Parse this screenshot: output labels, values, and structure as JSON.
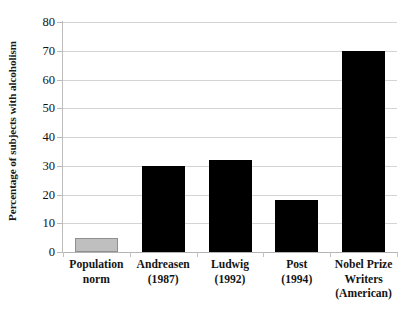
{
  "chart_data": {
    "type": "bar",
    "title": "",
    "xlabel": "",
    "ylabel": "Percentage of subjects with alcoholism",
    "ylim": [
      0,
      80
    ],
    "ytick_step": 10,
    "yticks": [
      "80",
      "70",
      "60",
      "50",
      "40",
      "30",
      "20",
      "10",
      "0"
    ],
    "ytick_values": [
      80,
      70,
      60,
      50,
      40,
      30,
      20,
      10,
      0
    ],
    "grid": "horizontal",
    "legend": "none",
    "categories": [
      "Population norm",
      "Andreasen (1987)",
      "Ludwig (1992)",
      "Post (1994)",
      "Nobel Prize Writers (American)"
    ],
    "category_lines": [
      [
        "Population",
        "norm"
      ],
      [
        "Andreasen",
        "(1987)"
      ],
      [
        "Ludwig",
        "(1992)"
      ],
      [
        "Post",
        "(1994)"
      ],
      [
        "Nobel Prize",
        "Writers",
        "(American)"
      ]
    ],
    "values": [
      5,
      30,
      32,
      18,
      70
    ],
    "bar_colors": [
      "#bfbfbf",
      "#000000",
      "#000000",
      "#000000",
      "#000000"
    ],
    "colors": {
      "bar_highlight": "#bfbfbf",
      "bar_default": "#000000",
      "gridline": "#d4d4d4",
      "axis": "#bdbdbd",
      "text": "#111111",
      "background": "#ffffff"
    }
  }
}
